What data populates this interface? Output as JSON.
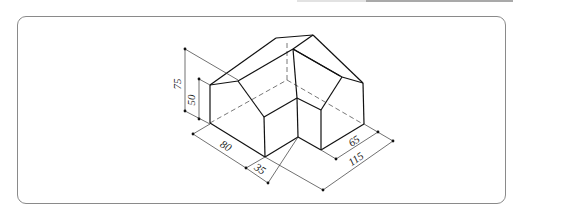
{
  "figure": {
    "type": "isometric technical drawing",
    "dimensions": {
      "total_height": "75",
      "wall_height": "50",
      "left_depth": "80",
      "notch": "35",
      "right_depth": "65",
      "total_width": "115"
    }
  },
  "colors": {
    "line": "#111111",
    "dim_line": "#333333",
    "frame": "#8a8a8a"
  }
}
